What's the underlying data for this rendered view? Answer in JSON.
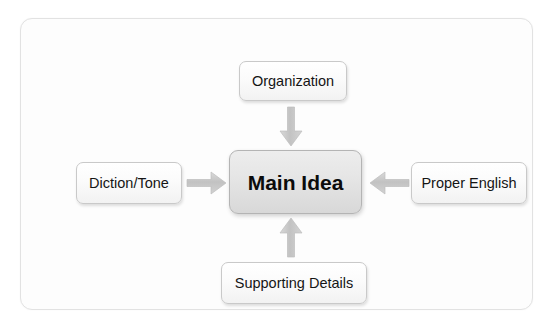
{
  "diagram": {
    "center": {
      "label": "Main Idea",
      "icon": "center-node"
    },
    "nodes": [
      {
        "id": "organization",
        "label": "Organization",
        "position": "top"
      },
      {
        "id": "diction-tone",
        "label": "Diction/Tone",
        "position": "left"
      },
      {
        "id": "proper-english",
        "label": "Proper English",
        "position": "right"
      },
      {
        "id": "supporting-details",
        "label": "Supporting Details",
        "position": "bottom"
      }
    ],
    "arrows": [
      {
        "id": "arrow-top",
        "icon": "arrow-down-icon",
        "from": "organization",
        "to": "main-idea",
        "direction": "down"
      },
      {
        "id": "arrow-bottom",
        "icon": "arrow-up-icon",
        "from": "supporting-details",
        "to": "main-idea",
        "direction": "up"
      },
      {
        "id": "arrow-left",
        "icon": "arrow-right-icon",
        "from": "diction-tone",
        "to": "main-idea",
        "direction": "right"
      },
      {
        "id": "arrow-right",
        "icon": "arrow-left-icon",
        "from": "proper-english",
        "to": "main-idea",
        "direction": "left"
      }
    ],
    "colors": {
      "frame_border": "#e2e2e2",
      "node_border": "#c9c9c9",
      "node_fill": "#fbfbfb",
      "center_fill": "#e6e6e6",
      "arrow_fill": "#c6c6c6",
      "text": "#151515",
      "background": "#ffffff"
    }
  }
}
